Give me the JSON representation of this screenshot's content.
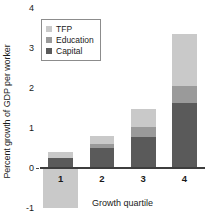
{
  "chart_data": {
    "type": "bar",
    "subtype": "stacked-bar",
    "title": "",
    "xlabel": "Growth quartile",
    "ylabel": "Percent growth of GDP per worker",
    "categories": [
      "1",
      "2",
      "3",
      "4"
    ],
    "series": [
      {
        "name": "Capital",
        "color": "#5a5a5a",
        "values": [
          0.25,
          0.5,
          0.78,
          1.62
        ]
      },
      {
        "name": "Education",
        "color": "#9a9a9a",
        "values": [
          0.0,
          0.1,
          0.25,
          0.42
        ]
      },
      {
        "name": "TFP",
        "color": "#c9c9c9",
        "values": [
          0.15,
          0.2,
          0.45,
          1.32
        ]
      }
    ],
    "totals": [
      0.4,
      0.8,
      1.48,
      3.36
    ],
    "ylim": [
      -1,
      4
    ],
    "yticks": [
      4,
      3,
      2,
      1,
      0,
      -1
    ],
    "ytick_labels": [
      "4",
      "3",
      "2",
      "1",
      "0",
      "-1"
    ],
    "grid": false,
    "legend_position": "top-left",
    "legend_order": [
      "TFP",
      "Education",
      "Capital"
    ]
  },
  "legend": {
    "entries": [
      {
        "label": "TFP",
        "color": "#c9c9c9"
      },
      {
        "label": "Education",
        "color": "#9a9a9a"
      },
      {
        "label": "Capital",
        "color": "#5a5a5a"
      }
    ]
  },
  "axes": {
    "y_title": "Percent growth of GDP per worker",
    "x_title": "Growth quartile",
    "y_ticks": [
      "4",
      "3",
      "2",
      "1",
      "0",
      "-1"
    ],
    "x_ticks": [
      "1",
      "2",
      "3",
      "4"
    ]
  },
  "colors": {
    "tfp": "#c9c9c9",
    "education": "#9a9a9a",
    "capital": "#5a5a5a",
    "axis": "#3d3d3d",
    "text": "#1a1a1a",
    "background": "#ffffff"
  }
}
